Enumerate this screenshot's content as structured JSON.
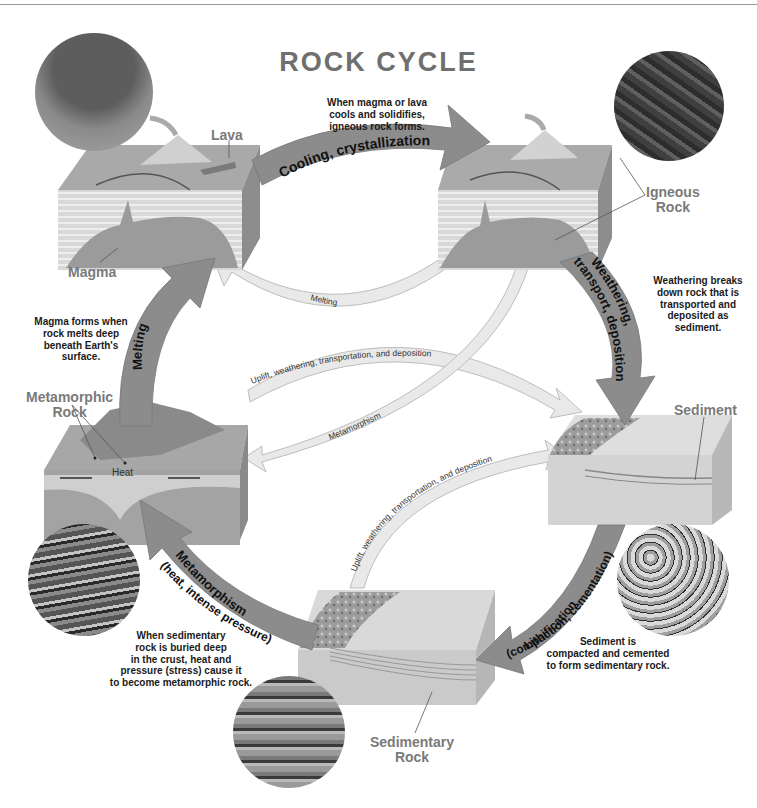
{
  "title": "ROCK CYCLE",
  "rock_labels": {
    "lava": "Lava",
    "magma": "Magma",
    "igneous": "Igneous Rock",
    "igneous_line1": "Igneous",
    "igneous_line2": "Rock",
    "sediment": "Sediment",
    "metamorphic_line1": "Metamorphic",
    "metamorphic_line2": "Rock",
    "sedimentary_line1": "Sedimentary",
    "sedimentary_line2": "Rock",
    "heat": "Heat"
  },
  "major_arrows": {
    "cooling": "Cooling, crystallization",
    "weathering_line1": "Weathering,",
    "weathering_line2": "transport, deposition",
    "lithification_line1": "Lithification",
    "lithification_line2": "(compaction, cementation)",
    "metamorphism_line1": "Metamorphism",
    "metamorphism_line2": "(heat, intense pressure)",
    "melting": "Melting"
  },
  "minor_arrows": {
    "melting": "Melting",
    "uplift_meta_to_sed": "Uplift, weathering, transportation, and deposition",
    "metamorphism": "Metamorphism",
    "uplift_sedrock_to_sed": "Uplift, weathering, transportation, and deposition"
  },
  "notes": {
    "igneous_line1": "When magma or lava",
    "igneous_line2": "cools and solidifies,",
    "igneous_line3": "igneous rock forms.",
    "weathering_line1": "Weathering breaks",
    "weathering_line2": "down rock that is",
    "weathering_line3": "transported and",
    "weathering_line4": "deposited as",
    "weathering_line5": "sediment.",
    "magma_line1": "Magma forms when",
    "magma_line2": "rock melts deep",
    "magma_line3": "beneath Earth's",
    "magma_line4": "surface.",
    "metamorphic_line1": "When sedimentary",
    "metamorphic_line2": "rock is buried deep",
    "metamorphic_line3": "in the crust, heat and",
    "metamorphic_line4": "pressure (stress) cause it",
    "metamorphic_line5": "to become metamorphic rock.",
    "sediment_line1": "Sediment is",
    "sediment_line2": "compacted and cemented",
    "sediment_line3": "to form sedimentary rock."
  },
  "colors": {
    "major_arrow": "#8c8c8c",
    "minor_arrow": "#e6e6e6",
    "label_gray": "#7a7a7a",
    "note_text": "#1a1a1a"
  }
}
